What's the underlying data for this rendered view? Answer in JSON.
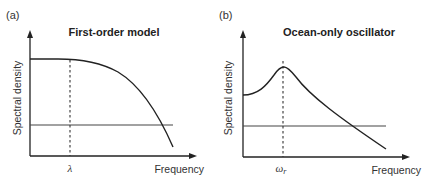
{
  "panels": [
    {
      "label": "(a)",
      "title": "First-order model",
      "ylabel": "Spectral density",
      "xlabel": "Frequency",
      "marker_label": "λ",
      "marker_subscript": ""
    },
    {
      "label": "(b)",
      "title": "Ocean-only oscillator",
      "ylabel": "Spectral density",
      "xlabel": "Frequency",
      "marker_label": "ω",
      "marker_subscript": "r"
    }
  ],
  "colors": {
    "line": "#222222",
    "background": "#ffffff"
  }
}
